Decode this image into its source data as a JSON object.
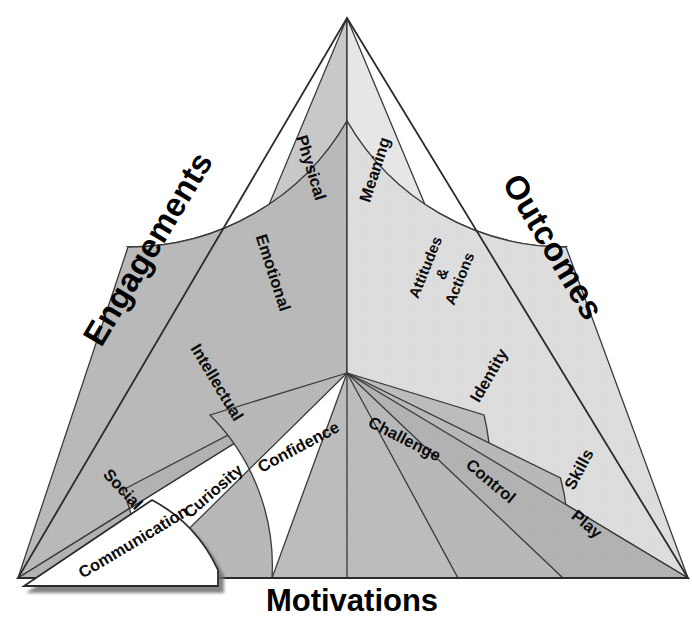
{
  "diagram": {
    "title_visible": false,
    "shape": "triangle",
    "colors": {
      "fill_dark_gray": "#b6b6b6",
      "fill_mid_gray": "#c9c9c9",
      "fill_light_gray": "#dcdcdc",
      "fill_pale_gray": "#efefef",
      "fill_white": "#ffffff",
      "line": "#3a3a3a",
      "text": "#0b0b0b",
      "shadow": "#9a9a9a"
    },
    "corner_labels": [
      {
        "id": "engagements",
        "text": "Engagements",
        "position": "left-edge"
      },
      {
        "id": "outcomes",
        "text": "Outcomes",
        "position": "right-edge"
      },
      {
        "id": "motivations",
        "text": "Motivations",
        "position": "bottom-edge"
      }
    ],
    "sectors": [
      {
        "id": "engagements",
        "name": "Engagements",
        "division": "concentric-rings",
        "segments": [
          {
            "label": "Physical",
            "ring": 1,
            "fill": "#c9c9c9"
          },
          {
            "label": "Emotional",
            "ring": 2,
            "fill": "#c4c4c4"
          },
          {
            "label": "Intellectual",
            "ring": 3,
            "fill": "#bfbfbf"
          },
          {
            "label": "Social",
            "ring": 4,
            "fill": "#bababa"
          },
          {
            "label": "Communication",
            "ring": 5,
            "fill": "#ffffff",
            "detached": true
          }
        ]
      },
      {
        "id": "outcomes",
        "name": "Outcomes",
        "division": "concentric-rings",
        "segments": [
          {
            "label": "Meaning",
            "ring": 1,
            "fill": "#e8e8e8"
          },
          {
            "label": "Attitudes\n&\nActions",
            "ring": 2,
            "fill": "#f4f4f4"
          },
          {
            "label": "Identity",
            "ring": 3,
            "fill": "#ececec"
          },
          {
            "label": "Skills",
            "ring": 4,
            "fill": "#dddddd"
          }
        ]
      },
      {
        "id": "motivations",
        "name": "Motivations",
        "division": "radial-wedges",
        "segments": [
          {
            "label": "Curiosity",
            "fill": "#b3b3b3"
          },
          {
            "label": "Confidence",
            "fill": "#b8b8b8"
          },
          {
            "label": "Challenge",
            "fill": "#bcbcbc"
          },
          {
            "label": "Control",
            "fill": "#b8b8b8"
          },
          {
            "label": "Play",
            "fill": "#b3b3b3"
          }
        ]
      }
    ],
    "labels": {
      "physical": "Physical",
      "emotional": "Emotional",
      "intellectual": "Intellectual",
      "social": "Social",
      "communication": "Communication",
      "meaning": "Meaning",
      "attitudes_line1": "Attitudes",
      "attitudes_line2": "&",
      "attitudes_line3": "Actions",
      "identity": "Identity",
      "skills": "Skills",
      "curiosity": "Curiosity",
      "confidence": "Confidence",
      "challenge": "Challenge",
      "control": "Control",
      "play": "Play",
      "engagements": "Engagements",
      "outcomes": "Outcomes",
      "motivations": "Motivations"
    }
  }
}
